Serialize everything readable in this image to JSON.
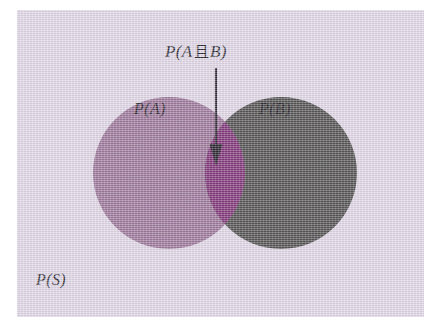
{
  "figure": {
    "type": "venn-diagram",
    "background_color": "#ded6e4",
    "page_color": "#ffffff"
  },
  "sets": {
    "a": {
      "label": "P(A)",
      "color": "#9b7398",
      "cx": 152,
      "cy": 163,
      "r": 76
    },
    "b": {
      "label": "P(B)",
      "color": "#4a4a48",
      "cx": 264,
      "cy": 163,
      "r": 76
    },
    "intersection": {
      "label": "P(A 且 B)",
      "label_prefix": "P(A",
      "label_connector": "且",
      "label_suffix": "B)",
      "color": "#7b2a72"
    },
    "sample_space": {
      "label": "P(S)"
    }
  },
  "annotation": {
    "arrow": {
      "name": "intersection-pointer",
      "color": "#1a1620",
      "x": 199,
      "y_start": 58,
      "y_end": 154
    }
  }
}
